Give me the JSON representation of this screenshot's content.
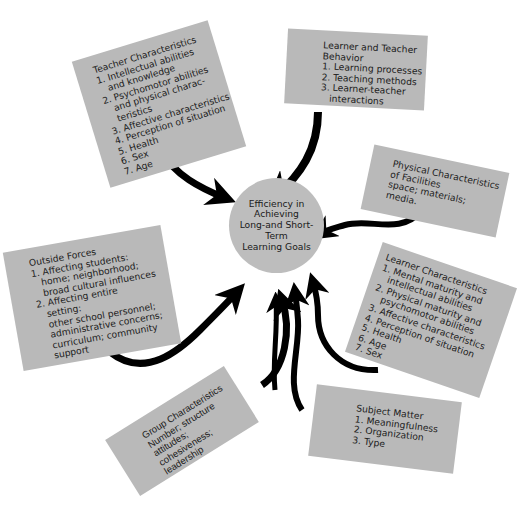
{
  "diagram": {
    "center": {
      "text": "Efficiency in\nAchieving\nLong-and Short-Term\nLearning Goals"
    },
    "boxes": {
      "teacher": {
        "title": "Teacher Characteristics",
        "items": [
          "1. Intellectual abilities",
          "   and knowledge",
          "2. Psychomotor abilities",
          "   and physical charac-",
          "   teristics",
          "3. Affective characteristics",
          "4. Perception of situation",
          "5. Health",
          "6. Sex",
          "7. Age"
        ]
      },
      "behavior": {
        "title_1": "Learner and Teacher",
        "title_2": "Behavior",
        "items": [
          "1. Learning processes",
          "2. Teaching methods",
          "3. Learner-teacher",
          "   interactions"
        ]
      },
      "facilities": {
        "lines": [
          "Physical Characteristics",
          "of Facilities",
          "space; materials;",
          "media."
        ]
      },
      "learner": {
        "title": "Learner Characteristics",
        "items": [
          "1. Mental maturity and",
          "   intellectual abilities",
          "2. Physical maturity and",
          "   psychomotor abilities",
          "3. Affective characteristics",
          "4. Perception of situation",
          "5. Health",
          "6. Age",
          "7. Sex"
        ]
      },
      "outside": {
        "title": "Outside Forces",
        "items": [
          "1. Affecting students:",
          "   home; neighborhood;",
          "   broad cultural influences",
          "2. Affecting entire",
          "   setting:",
          "   other school personnel;",
          "   administrative concerns;",
          "   curriculum; community",
          "   support"
        ]
      },
      "group": {
        "lines": [
          "Group Characteristics",
          "Number; structure",
          "attitudes;",
          "cohesiveness;",
          "leadership"
        ]
      },
      "subject": {
        "title": "Subject Matter",
        "items": [
          "1. Meaningfulness",
          "2. Organization",
          "3. Type"
        ]
      }
    },
    "colors": {
      "box_fill": "#b9b9b9",
      "circle_fill": "#bdbdbd",
      "arrow": "#000000",
      "text": "#1c1c1c"
    }
  }
}
